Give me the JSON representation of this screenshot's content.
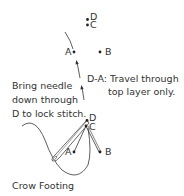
{
  "diagram": {
    "caption": "Crow Footing",
    "top_points": {
      "D": "D",
      "C": "C",
      "A": "A",
      "B": "B"
    },
    "bottom_points": {
      "D": "D",
      "C": "C",
      "A": "A",
      "B": "B"
    },
    "annotation_travel": {
      "line1": "D-A: Travel through",
      "line2": "top layer only."
    },
    "annotation_lock": {
      "line1": "Bring needle",
      "line2": "down through",
      "line3": "D to lock stitch."
    },
    "colors": {
      "ink": "#333333",
      "thread": "#444444",
      "needle": "#555555"
    }
  }
}
